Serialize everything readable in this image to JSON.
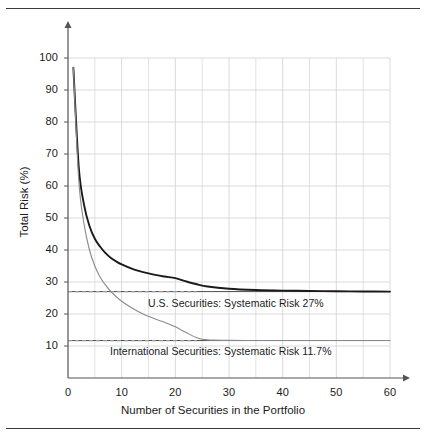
{
  "chart_data": {
    "type": "line",
    "title": "",
    "xlabel": "Number of Securities in the Portfolio",
    "ylabel": "Total Risk (%)",
    "xlim": [
      0,
      60
    ],
    "ylim": [
      0,
      100
    ],
    "xticks": [
      "0",
      "10",
      "20",
      "30",
      "40",
      "50",
      "60"
    ],
    "xtick_values": [
      0,
      10,
      20,
      30,
      40,
      50,
      60
    ],
    "yticks": [
      "10",
      "20",
      "30",
      "40",
      "50",
      "60",
      "70",
      "80",
      "90",
      "100"
    ],
    "ytick_values": [
      10,
      20,
      30,
      40,
      50,
      60,
      70,
      80,
      90,
      100
    ],
    "grid": true,
    "grid_minor_x_step": 5,
    "legend": "none",
    "series": [
      {
        "name": "U.S. Securities",
        "color": "#1a1a1a",
        "asymptote": 27,
        "asymptote_label": "Systematic Risk 27%",
        "x": [
          1,
          2,
          3,
          4,
          5,
          6,
          7,
          8,
          9,
          10,
          12,
          14,
          16,
          18,
          20,
          22,
          24,
          26,
          30,
          35,
          40,
          45,
          50,
          55,
          60
        ],
        "values": [
          97,
          66,
          54,
          47.5,
          43.5,
          41,
          39,
          37.5,
          36.4,
          35.5,
          34.1,
          33.1,
          32.3,
          31.7,
          31.2,
          30.2,
          29.3,
          28.6,
          27.9,
          27.5,
          27.3,
          27.2,
          27.1,
          27.05,
          27
        ]
      },
      {
        "name": "International Securities",
        "color": "#8a8a8a",
        "asymptote": 11.7,
        "asymptote_label": "Systematic Risk 11.7%",
        "x": [
          1,
          2,
          3,
          4,
          5,
          6,
          7,
          8,
          9,
          10,
          12,
          14,
          16,
          18,
          20,
          22,
          24,
          26,
          30,
          35,
          40,
          45,
          50,
          55,
          60
        ],
        "values": [
          97,
          62,
          48,
          40,
          35,
          31.5,
          29,
          27,
          25.4,
          24,
          21.8,
          20,
          18.6,
          17.4,
          16,
          14.2,
          12.6,
          11.9,
          11.75,
          11.7,
          11.7,
          11.7,
          11.7,
          11.7,
          11.7
        ]
      }
    ],
    "reference_lines": [
      {
        "name": "us-systematic-risk",
        "y": 27,
        "style": "dashed",
        "color": "#9a9a9a"
      },
      {
        "name": "intl-systematic-risk",
        "y": 11.7,
        "style": "dashed",
        "color": "#9a9a9a"
      }
    ],
    "annotations": [
      {
        "name": "us-annotation",
        "text": "U.S. Securities:  Systematic Risk 27%"
      },
      {
        "name": "intl-annotation",
        "text": "International Securities:  Systematic Risk 11.7%"
      }
    ]
  },
  "axis": {
    "ylabel": "Total Risk (%)",
    "xlabel": "Number of Securities in the Portfolio",
    "xticks": [
      "0",
      "10",
      "20",
      "30",
      "40",
      "50",
      "60"
    ],
    "yticks": [
      "10",
      "20",
      "30",
      "40",
      "50",
      "60",
      "70",
      "80",
      "90",
      "100"
    ]
  },
  "annotations": {
    "us": "U.S. Securities:  Systematic Risk 27%",
    "intl": "International Securities:  Systematic Risk 11.7%"
  },
  "colors": {
    "us_curve": "#1a1a1a",
    "intl_curve": "#8a8a8a",
    "grid": "#d6d6d6",
    "axis": "#555555",
    "dashed": "#9a9a9a",
    "frame_rule": "#3a3a3a"
  }
}
